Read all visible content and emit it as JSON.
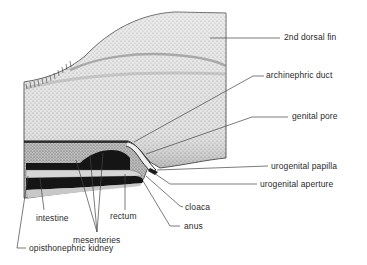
{
  "figure": {
    "labels": {
      "dorsal_fin": "2nd dorsal fin",
      "archinephric_duct": "archinephric duct",
      "genital_pore": "genital pore",
      "urogenital_papilla": "urogenital papilla",
      "urogenital_aperture": "urogenital aperture",
      "cloaca": "cloaca",
      "anus": "anus",
      "intestine": "intestine",
      "rectum": "rectum",
      "mesenteries": "mesenteries",
      "opisthonephric_kidney": "opisthonephric kidney"
    },
    "colors": {
      "background": "#ffffff",
      "stipple_light": "#d9d9d9",
      "stipple_mid": "#b8b8b8",
      "dark_band": "#151515",
      "leader_line": "#444444",
      "text": "#2a2a2a"
    }
  }
}
